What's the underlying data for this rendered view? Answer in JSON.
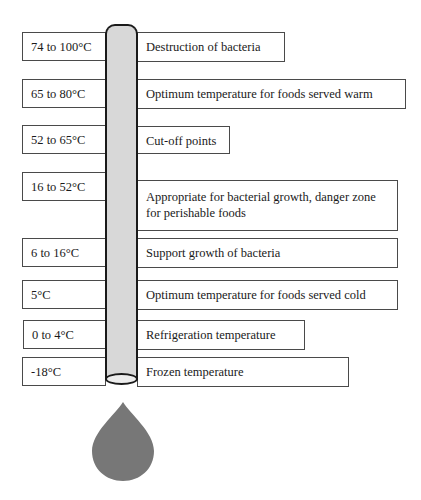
{
  "diagram": {
    "tube_color": "#d8d8d8",
    "drop_color": "#777777",
    "rows": [
      {
        "range": "74 to 100°C",
        "description": "Destruction of bacteria"
      },
      {
        "range": "65 to 80°C",
        "description": "Optimum temperature for foods served warm"
      },
      {
        "range": "52 to 65°C",
        "description": "Cut-off points"
      },
      {
        "range": "16 to 52°C",
        "description": "Appropriate for bacterial growth, danger zone for perishable foods"
      },
      {
        "range": "6 to 16°C",
        "description": "Support growth of bacteria"
      },
      {
        "range": "5°C",
        "description": "Optimum temperature for foods served cold"
      },
      {
        "range": "0 to 4°C",
        "description": "Refrigeration temperature"
      },
      {
        "range": "-18°C",
        "description": "Frozen temperature"
      }
    ]
  }
}
